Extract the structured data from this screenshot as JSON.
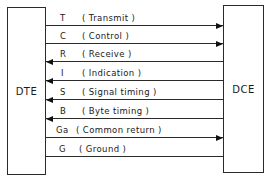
{
  "diagram": {
    "left_box": {
      "label": "DTE"
    },
    "right_box": {
      "label": "DCE"
    },
    "signals": [
      {
        "code": "T",
        "description": "( Transmit )",
        "direction": "to-dce",
        "line_y": 25
      },
      {
        "code": "C",
        "description": "( Control )",
        "direction": "to-dce",
        "line_y": 43
      },
      {
        "code": "R",
        "description": "( Receive )",
        "direction": "to-dte",
        "line_y": 61
      },
      {
        "code": "I",
        "description": "( Indication )",
        "direction": "to-dte",
        "line_y": 80
      },
      {
        "code": "S",
        "description": "( Signal timing )",
        "direction": "to-dte",
        "line_y": 99
      },
      {
        "code": "B",
        "description": "( Byte timing )",
        "direction": "to-dte",
        "line_y": 118
      },
      {
        "code": "Ga",
        "description": "( Common return )",
        "direction": "to-dce",
        "line_y": 137
      },
      {
        "code": "G",
        "description": "( Ground )",
        "direction": "none",
        "line_y": 156
      }
    ]
  }
}
